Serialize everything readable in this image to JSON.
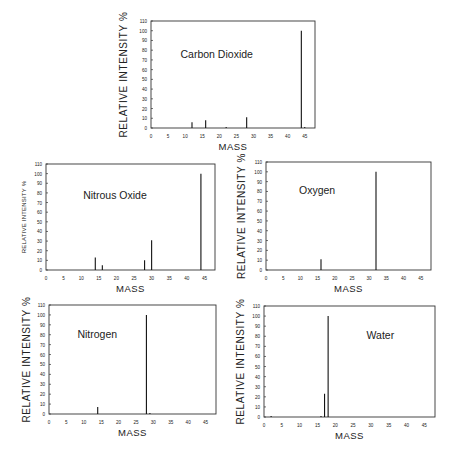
{
  "figure": {
    "ylabel": "RELATIVE INTENSITY %",
    "xlabel": "MASS"
  },
  "chart_data": [
    {
      "type": "bar",
      "title": "Carbon Dioxide",
      "xlabel": "MASS",
      "ylabel": "RELATIVE INTENSITY %",
      "xlim": [
        0,
        48
      ],
      "ylim": [
        0,
        110
      ],
      "xticks": [
        0,
        5,
        10,
        15,
        20,
        25,
        30,
        35,
        40,
        45
      ],
      "yticks": [
        0,
        10,
        20,
        30,
        40,
        50,
        60,
        70,
        80,
        90,
        100,
        110
      ],
      "x": [
        12,
        16,
        22,
        28,
        44,
        45
      ],
      "values": [
        6,
        8,
        1,
        11,
        100,
        1
      ],
      "grid": false,
      "legend": null
    },
    {
      "type": "bar",
      "title": "Nitrous Oxide",
      "xlabel": "MASS",
      "ylabel": "RELATIVE INTENSITY %",
      "xlim": [
        0,
        48
      ],
      "ylim": [
        0,
        110
      ],
      "xticks": [
        0,
        5,
        10,
        15,
        20,
        25,
        30,
        35,
        40,
        45
      ],
      "yticks": [
        0,
        10,
        20,
        30,
        40,
        50,
        60,
        70,
        80,
        90,
        100,
        110
      ],
      "x": [
        14,
        16,
        28,
        30,
        44
      ],
      "values": [
        13,
        5,
        10,
        31,
        100
      ],
      "grid": false,
      "legend": null
    },
    {
      "type": "bar",
      "title": "Oxygen",
      "xlabel": "MASS",
      "ylabel": "RELATIVE INTENSITY %",
      "xlim": [
        0,
        48
      ],
      "ylim": [
        0,
        110
      ],
      "xticks": [
        0,
        5,
        10,
        15,
        20,
        25,
        30,
        35,
        40,
        45
      ],
      "yticks": [
        0,
        10,
        20,
        30,
        40,
        50,
        60,
        70,
        80,
        90,
        100,
        110
      ],
      "x": [
        16,
        32
      ],
      "values": [
        11,
        100
      ],
      "grid": false,
      "legend": null
    },
    {
      "type": "bar",
      "title": "Nitrogen",
      "xlabel": "MASS",
      "ylabel": "RELATIVE INTENSITY %",
      "xlim": [
        0,
        48
      ],
      "ylim": [
        0,
        110
      ],
      "xticks": [
        0,
        5,
        10,
        15,
        20,
        25,
        30,
        35,
        40,
        45
      ],
      "yticks": [
        0,
        10,
        20,
        30,
        40,
        50,
        60,
        70,
        80,
        90,
        100,
        110
      ],
      "x": [
        14,
        28,
        29
      ],
      "values": [
        7,
        100,
        1
      ],
      "grid": false,
      "legend": null
    },
    {
      "type": "bar",
      "title": "Water",
      "xlabel": "MASS",
      "ylabel": "RELATIVE INTENSITY %",
      "xlim": [
        0,
        48
      ],
      "ylim": [
        0,
        110
      ],
      "xticks": [
        0,
        5,
        10,
        15,
        20,
        25,
        30,
        35,
        40,
        45
      ],
      "yticks": [
        0,
        10,
        20,
        30,
        40,
        50,
        60,
        70,
        80,
        90,
        100,
        110
      ],
      "x": [
        2,
        16,
        17,
        18
      ],
      "values": [
        1,
        1,
        23,
        100
      ],
      "grid": false,
      "legend": null
    }
  ]
}
